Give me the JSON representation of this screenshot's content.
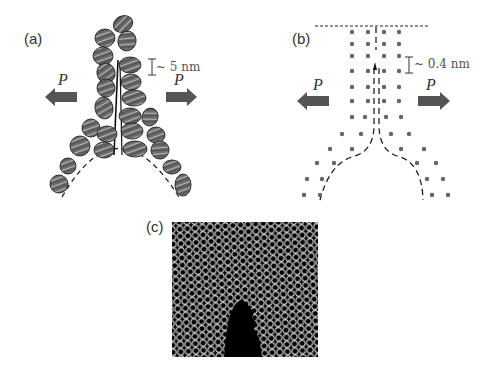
{
  "figure": {
    "panels": [
      {
        "id": "a",
        "label": "(a)",
        "scale_bar_text": "~ 5 nm",
        "force_left": "P",
        "force_right": "P",
        "description": "Coarse-grained fibril model: stacked helical units forming a crack tip"
      },
      {
        "id": "b",
        "label": "(b)",
        "scale_bar_text": "~ 0.4 nm",
        "force_left": "P",
        "force_right": "P",
        "description": "Atomic lattice schematic with dashed crack opening"
      },
      {
        "id": "c",
        "label": "(c)",
        "description": "Simulated honeycomb lattice with crack"
      }
    ],
    "colors": {
      "arrow": "#555555",
      "unit_fill": "#6e6e6e",
      "unit_stroke": "#222222",
      "dot": "#666666",
      "dash": "#222222",
      "lattice_bg": "#000000",
      "lattice_line": "#d8d8d8"
    }
  }
}
